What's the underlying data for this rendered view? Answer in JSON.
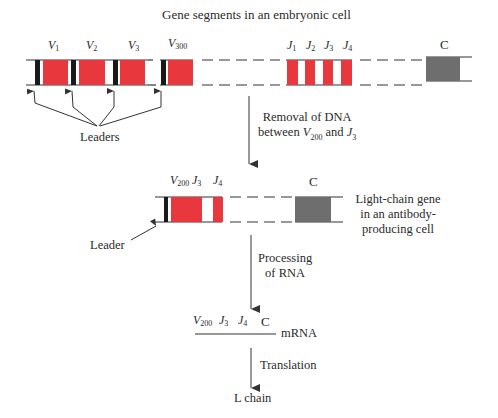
{
  "title": "Gene segments in an embryonic cell",
  "colors": {
    "segment_red": "#e8383d",
    "leader_black": "#1a1a1a",
    "constant_gray": "#6e6e6e",
    "line": "#333333"
  },
  "embryonic": {
    "v_labels": [
      {
        "base": "V",
        "sub": "1"
      },
      {
        "base": "V",
        "sub": "2"
      },
      {
        "base": "V",
        "sub": "3"
      },
      {
        "base": "V",
        "sub": "300"
      }
    ],
    "j_labels": [
      {
        "base": "J",
        "sub": "1"
      },
      {
        "base": "J",
        "sub": "2"
      },
      {
        "base": "J",
        "sub": "3"
      },
      {
        "base": "J",
        "sub": "4"
      }
    ],
    "c_label": "C",
    "leaders_label": "Leaders"
  },
  "step1": {
    "line1": "Removal of DNA",
    "line2_prefix": "between ",
    "line2_v": {
      "base": "V",
      "sub": "200"
    },
    "line2_mid": " and ",
    "line2_j": {
      "base": "J",
      "sub": "3"
    }
  },
  "rearranged": {
    "labels": [
      {
        "base": "V",
        "sub": "200"
      },
      {
        "base": "J",
        "sub": "3"
      },
      {
        "base": "J",
        "sub": "4"
      }
    ],
    "c_label": "C",
    "leader_label": "Leader",
    "description": [
      "Light-chain gene",
      "in an antibody-",
      "producing cell"
    ]
  },
  "step2": {
    "line1": "Processing",
    "line2": "of RNA"
  },
  "mrna": {
    "labels": [
      {
        "base": "V",
        "sub": "200"
      },
      {
        "base": "J",
        "sub": "3"
      },
      {
        "base": "J",
        "sub": "4"
      }
    ],
    "c_label": "C",
    "name": "mRNA"
  },
  "step3": {
    "label": "Translation"
  },
  "product": {
    "label": "L chain"
  }
}
